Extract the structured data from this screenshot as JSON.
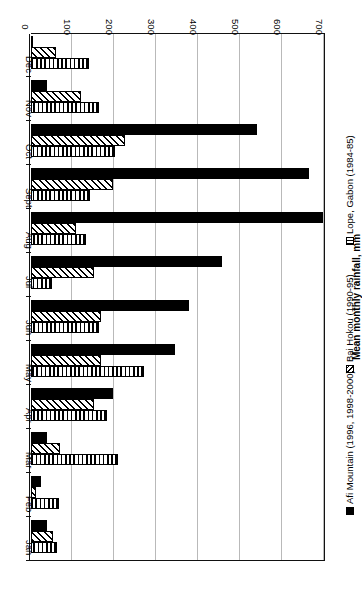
{
  "chart_data": {
    "type": "bar",
    "orientation": "horizontal",
    "title": "",
    "xlabel": "",
    "ylabel": "Mean monthly rainfall, mm",
    "categories": [
      "Jan",
      "Feb",
      "Mar",
      "Apr",
      "May",
      "Jun",
      "Jul",
      "Aug",
      "Sept",
      "Oct",
      "Nov",
      "Dec"
    ],
    "tick_labels": [
      "0",
      "100",
      "200",
      "300",
      "400",
      "500",
      "600",
      "700"
    ],
    "ticks": [
      0,
      100,
      200,
      300,
      400,
      500,
      600,
      700
    ],
    "xlim": [
      0,
      700
    ],
    "grid": true,
    "legend_position": "left",
    "series": [
      {
        "name": "Afi Mountain (1996, 1998-2000)",
        "pattern": "solid-black",
        "values": [
          37,
          25,
          39,
          195,
          344,
          376,
          454,
          696,
          663,
          539,
          37,
          2
        ]
      },
      {
        "name": "Bai Hokou (1990-95)",
        "pattern": "diagonal-hatch",
        "values": [
          52,
          13,
          68,
          149,
          166,
          166,
          151,
          106,
          195,
          225,
          120,
          59
        ]
      },
      {
        "name": "Lope, Gabon (1984-85)",
        "pattern": "vertical-stripe",
        "values": [
          63,
          66,
          207,
          180,
          268,
          161,
          49,
          132,
          140,
          200,
          163,
          137
        ]
      }
    ]
  },
  "legend": {
    "items": [
      {
        "label": "Afi Mountain (1996, 1998-2000)",
        "swatch": "solid-black-square-icon"
      },
      {
        "label": "Bai Hokou (1990-95)",
        "swatch": "diagonal-hatch-square-icon"
      },
      {
        "label": "Lope, Gabon (1984-85)",
        "swatch": "vertical-stripe-square-icon"
      }
    ]
  },
  "axis": {
    "value_title": "Mean monthly rainfall, mm"
  }
}
